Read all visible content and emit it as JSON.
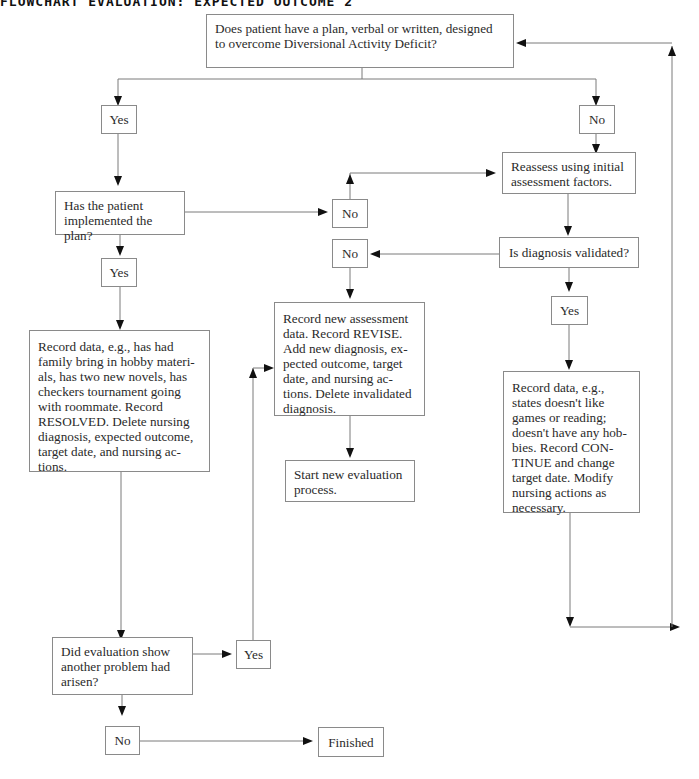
{
  "title": "FLOWCHART EVALUATION: EXPECTED OUTCOME 2",
  "nodes": {
    "q_plan": "Does patient have a plan, verbal or written, designed to overcome Diversional Activity Deficit?",
    "yes1": "Yes",
    "no1": "No",
    "q_implemented": "Has the patient implemented the plan?",
    "no_impl": "No",
    "yes_impl": "Yes",
    "reassess": "Reassess using initial assessment factors.",
    "q_validated": "Is diagnosis validated?",
    "no_valid": "No",
    "yes_valid": "Yes",
    "record_resolved": "Record data, e.g., has had family bring in hobby materi-als, has two new novels, has checkers tournament going with roommate. Record RESOLVED. Delete nursing diagnosis, expected outcome, target date, and nursing ac-tions.",
    "record_revise": "Record new assessment data. Record REVISE. Add new diagnosis, ex-pected outcome, target date, and nursing ac-tions. Delete invalidated diagnosis.",
    "start_new": "Start new evaluation process.",
    "record_continue": "Record data, e.g., states doesn't like games or reading; doesn't have any hob-bies. Record CON-TINUE and change target date. Modify nursing actions as necessary.",
    "q_another": "Did evaluation show another problem had arisen?",
    "yes_another": "Yes",
    "no_another": "No",
    "finished": "Finished"
  },
  "colors": {
    "line": "#7a7a7a",
    "arrowhead": "#111111",
    "border": "#8a8a8a",
    "text": "#2a2a2a"
  }
}
